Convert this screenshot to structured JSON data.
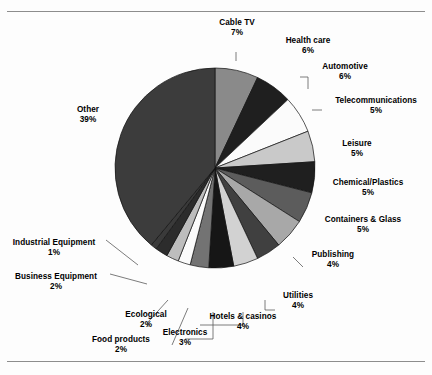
{
  "document": {
    "caption_top_faint": "",
    "caption_bottom_faint": ""
  },
  "chart_data": {
    "type": "pie",
    "title": "",
    "xlabel": "",
    "ylabel": "",
    "units": "percent",
    "total": 100,
    "start_angle_deg": 0,
    "direction": "clockwise",
    "legend": "none (direct labels with leader lines)",
    "categories": [
      "Cable TV",
      "Health care",
      "Automotive",
      "Telecommunications",
      "Leisure",
      "Chemical/Plastics",
      "Containers & Glass",
      "Publishing",
      "Utilities",
      "Hotels & casinos",
      "Electronics",
      "Food products",
      "Ecological",
      "Business Equipment",
      "Industrial Equipment",
      "Other"
    ],
    "values": [
      7,
      6,
      6,
      5,
      5,
      5,
      5,
      4,
      4,
      4,
      3,
      2,
      2,
      2,
      1,
      39
    ],
    "value_labels": [
      "7%",
      "6%",
      "6%",
      "5%",
      "5%",
      "5%",
      "5%",
      "4%",
      "4%",
      "4%",
      "3%",
      "2%",
      "2%",
      "2%",
      "1%",
      "39%"
    ],
    "colors": [
      "#8a8a8a",
      "#1f1f1f",
      "#fbfbfb",
      "#c9c9c9",
      "#1f1f1f",
      "#5c5c5c",
      "#a8a8a8",
      "#404040",
      "#d2d2d2",
      "#161616",
      "#737373",
      "#fbfbfb",
      "#bdbdbd",
      "#2c2c2c",
      "#3a3a3a",
      "#3c3c3c"
    ],
    "slices": [
      {
        "label": "Cable TV",
        "value": 7,
        "pct": "7%",
        "color": "#8a8a8a"
      },
      {
        "label": "Health care",
        "value": 6,
        "pct": "6%",
        "color": "#1f1f1f"
      },
      {
        "label": "Automotive",
        "value": 6,
        "pct": "6%",
        "color": "#fbfbfb"
      },
      {
        "label": "Telecommunications",
        "value": 5,
        "pct": "5%",
        "color": "#c9c9c9"
      },
      {
        "label": "Leisure",
        "value": 5,
        "pct": "5%",
        "color": "#1f1f1f"
      },
      {
        "label": "Chemical/Plastics",
        "value": 5,
        "pct": "5%",
        "color": "#5c5c5c"
      },
      {
        "label": "Containers & Glass",
        "value": 5,
        "pct": "5%",
        "color": "#a8a8a8"
      },
      {
        "label": "Publishing",
        "value": 4,
        "pct": "4%",
        "color": "#404040"
      },
      {
        "label": "Utilities",
        "value": 4,
        "pct": "4%",
        "color": "#d2d2d2"
      },
      {
        "label": "Hotels & casinos",
        "value": 4,
        "pct": "4%",
        "color": "#161616"
      },
      {
        "label": "Electronics",
        "value": 3,
        "pct": "3%",
        "color": "#737373"
      },
      {
        "label": "Food products",
        "value": 2,
        "pct": "2%",
        "color": "#fbfbfb"
      },
      {
        "label": "Ecological",
        "value": 2,
        "pct": "2%",
        "color": "#bdbdbd"
      },
      {
        "label": "Business Equipment",
        "value": 2,
        "pct": "2%",
        "color": "#2c2c2c"
      },
      {
        "label": "Industrial Equipment",
        "value": 1,
        "pct": "1%",
        "color": "#3a3a3a"
      },
      {
        "label": "Other",
        "value": 39,
        "pct": "39%",
        "color": "#3c3c3c"
      }
    ]
  },
  "geometry": {
    "center_x": 215,
    "center_y": 156,
    "radius": 100
  }
}
